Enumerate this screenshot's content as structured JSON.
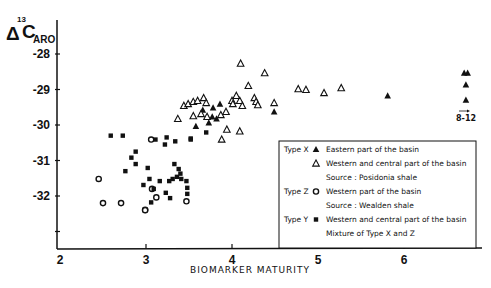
{
  "chart_data": {
    "type": "scatter",
    "title": "",
    "xlabel": "BIOMARKER MATURITY",
    "ylabel": "Δ13C ARO",
    "ylabel_parts": {
      "delta": "Δ",
      "sup": "13",
      "main": "C",
      "sub": "ARO"
    },
    "xlim": [
      2,
      6.9
    ],
    "ylim": [
      -33,
      -27.1
    ],
    "x_ticks": [
      2,
      3,
      4,
      5,
      6
    ],
    "x_tick_labels": [
      "2",
      "3",
      "4",
      "5",
      "6"
    ],
    "y_ticks": [
      -28,
      -29,
      -30,
      -31,
      -32,
      -33
    ],
    "y_tick_labels": [
      "-28",
      "-29",
      "-30",
      "-31",
      "-32",
      ""
    ],
    "grid": false,
    "legend_position": "lower right (inside)",
    "annotation": {
      "text": "8-12",
      "arrow": "→",
      "x": 6.8,
      "y": -30.8
    },
    "series": [
      {
        "name": "Type X — Eastern part of the basin",
        "marker": "filled-triangle",
        "points": [
          [
            3.66,
            -29.58
          ],
          [
            3.86,
            -29.41
          ],
          [
            3.77,
            -29.77
          ],
          [
            3.82,
            -29.83
          ],
          [
            3.73,
            -29.94
          ],
          [
            3.58,
            -30.04
          ],
          [
            4.49,
            -29.63
          ],
          [
            3.78,
            -29.52
          ],
          [
            5.81,
            -29.18
          ],
          [
            6.7,
            -28.54
          ],
          [
            6.74,
            -28.54
          ],
          [
            6.72,
            -28.87
          ],
          [
            6.72,
            -29.3
          ]
        ]
      },
      {
        "name": "Type X — Western and central part of the basin",
        "marker": "open-triangle",
        "points": [
          [
            3.44,
            -29.46
          ],
          [
            3.49,
            -29.41
          ],
          [
            3.55,
            -29.35
          ],
          [
            3.6,
            -29.32
          ],
          [
            3.67,
            -29.24
          ],
          [
            3.7,
            -29.38
          ],
          [
            3.37,
            -29.83
          ],
          [
            3.55,
            -29.75
          ],
          [
            3.64,
            -29.69
          ],
          [
            3.71,
            -29.77
          ],
          [
            3.87,
            -29.72
          ],
          [
            3.93,
            -29.63
          ],
          [
            4.0,
            -29.32
          ],
          [
            4.01,
            -29.41
          ],
          [
            3.94,
            -30.13
          ],
          [
            4.09,
            -29.32
          ],
          [
            4.05,
            -29.18
          ],
          [
            4.12,
            -29.46
          ],
          [
            4.26,
            -29.24
          ],
          [
            4.28,
            -29.35
          ],
          [
            4.3,
            -29.44
          ],
          [
            4.49,
            -29.38
          ],
          [
            4.09,
            -30.18
          ],
          [
            3.88,
            -30.41
          ],
          [
            4.1,
            -28.27
          ],
          [
            4.38,
            -28.54
          ],
          [
            4.19,
            -28.9
          ],
          [
            4.77,
            -28.99
          ],
          [
            4.86,
            -29.01
          ],
          [
            5.07,
            -29.1
          ],
          [
            5.27,
            -28.96
          ]
        ]
      },
      {
        "name": "Type Z — Western part of the basin",
        "marker": "open-circle",
        "points": [
          [
            2.45,
            -31.52
          ],
          [
            2.5,
            -32.2
          ],
          [
            2.71,
            -32.2
          ],
          [
            2.99,
            -32.39
          ],
          [
            3.06,
            -30.41
          ],
          [
            3.07,
            -31.8
          ],
          [
            3.12,
            -32.04
          ],
          [
            3.47,
            -32.15
          ],
          [
            2.99,
            -32.4
          ]
        ]
      },
      {
        "name": "Type Y — Western and central part of the basin",
        "marker": "filled-square",
        "points": [
          [
            2.59,
            -30.3
          ],
          [
            2.73,
            -30.3
          ],
          [
            2.88,
            -30.75
          ],
          [
            2.83,
            -30.92
          ],
          [
            2.88,
            -31.1
          ],
          [
            2.76,
            -31.3
          ],
          [
            2.97,
            -31.69
          ],
          [
            3.11,
            -30.41
          ],
          [
            3.24,
            -30.35
          ],
          [
            3.22,
            -30.55
          ],
          [
            3.34,
            -30.46
          ],
          [
            3.52,
            -30.38
          ],
          [
            3.33,
            -31.1
          ],
          [
            3.38,
            -31.24
          ],
          [
            3.4,
            -31.37
          ],
          [
            3.36,
            -31.46
          ],
          [
            3.31,
            -31.52
          ],
          [
            3.27,
            -31.58
          ],
          [
            3.41,
            -31.52
          ],
          [
            3.47,
            -31.58
          ],
          [
            3.02,
            -31.21
          ],
          [
            3.04,
            -31.52
          ],
          [
            3.16,
            -31.58
          ],
          [
            3.09,
            -31.8
          ],
          [
            3.23,
            -31.91
          ],
          [
            3.28,
            -32.06
          ],
          [
            3.48,
            -31.77
          ],
          [
            3.48,
            -31.94
          ],
          [
            3.06,
            -32.18
          ],
          [
            3.7,
            -30.21
          ],
          [
            3.52,
            -30.41
          ]
        ]
      }
    ]
  },
  "legend": {
    "rows": [
      {
        "type_label": "Type X",
        "marker": "filled-triangle",
        "text": "Eastern part of the basin"
      },
      {
        "type_label": "",
        "marker": "open-triangle",
        "text": "Western and central part of the basin"
      },
      {
        "type_label": "",
        "marker": "",
        "text": "Source : Posidonia shale"
      },
      {
        "type_label": "Type Z",
        "marker": "open-circle",
        "text": "Western part of the basin"
      },
      {
        "type_label": "",
        "marker": "",
        "text": "Source : Wealden shale"
      },
      {
        "type_label": "Type Y",
        "marker": "filled-square",
        "text": "Western and central part of the basin"
      },
      {
        "type_label": "",
        "marker": "",
        "text": "Mixture of Type X and Z"
      }
    ]
  }
}
